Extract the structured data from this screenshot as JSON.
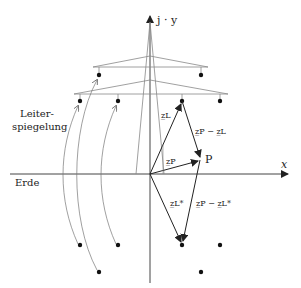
{
  "diagram": {
    "axes": {
      "y_label": "j · y",
      "x_label": "x"
    },
    "labels": {
      "mirroring": [
        "Leiter-",
        "spiegelung"
      ],
      "ground": "Erde",
      "point": "P",
      "z_L": "z̲L",
      "z_P": "z̲P",
      "z_P_minus_z_L": "z̲P − z̲L",
      "z_L_conj": "z̲L*",
      "z_P_minus_z_L_conj": "z̲P − z̲L*"
    },
    "colors": {
      "lines": "#555555",
      "vectors": "#222222",
      "background": "#ffffff"
    }
  }
}
